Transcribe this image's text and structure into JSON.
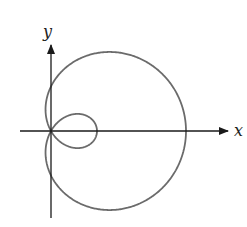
{
  "figure": {
    "type": "polar-curve",
    "equation": "r = a + b cos(theta), b > a",
    "params": {
      "a": 44.5,
      "b": 90.5
    },
    "origin_px": [
      51,
      131
    ],
    "x_axis": {
      "label": "x",
      "from_px": 20,
      "to_px": 228
    },
    "y_axis": {
      "label": "y",
      "from_px": 218,
      "to_px": 45
    },
    "colors": {
      "curve": "#6b6b6b",
      "axes": "#1a1a1a",
      "background": "#ffffff"
    }
  }
}
